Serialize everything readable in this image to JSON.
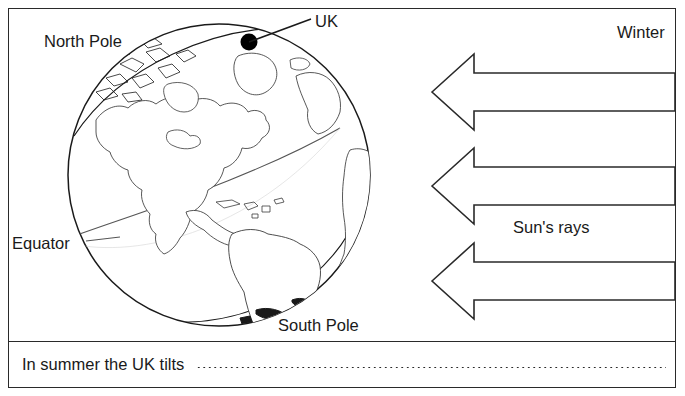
{
  "worksheet": {
    "title": "Earth tilt and sun's rays diagram",
    "labels": {
      "north_pole": "North Pole",
      "uk": "UK",
      "equator": "Equator",
      "south_pole": "South Pole",
      "winter": "Winter",
      "suns_rays": "Sun's rays"
    },
    "question": {
      "prompt": "In summer the UK tilts",
      "answer_value": ""
    },
    "arrows": {
      "count": 3,
      "direction": "left",
      "meaning": "Sun's rays"
    },
    "colors": {
      "ink": "#1a1a1a",
      "line": "#2a2a2a",
      "paper": "#ffffff",
      "marker": "#000000"
    }
  }
}
